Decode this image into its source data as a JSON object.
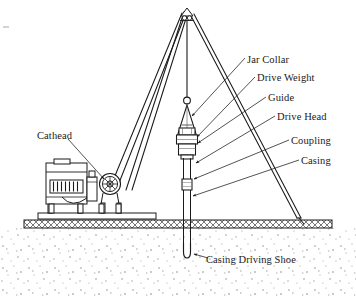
{
  "figure": {
    "background_color": "#ffffff",
    "line_color": "#1a1a1a",
    "labels": {
      "jar_collar": "Jar Collar",
      "drive_weight": "Drive Weight",
      "guide": "Guide",
      "drive_head": "Drive Head",
      "coupling": "Coupling",
      "casing": "Casing",
      "cathead": "Cathead",
      "casing_driving_shoe": "Casing Driving Shoe"
    },
    "parts": [
      {
        "name": "tripod-derrick",
        "description": "three-leg derrick with apex sheave"
      },
      {
        "name": "hoist-line",
        "description": "vertical cable from apex to jar collar"
      },
      {
        "name": "jar-collar",
        "description": "small ring on hoist line"
      },
      {
        "name": "guide",
        "description": "conical guide below jar collar"
      },
      {
        "name": "drive-weight",
        "description": "cylindrical block below guide"
      },
      {
        "name": "drive-head",
        "description": "collar atop the casing"
      },
      {
        "name": "coupling",
        "description": "pipe coupling collar on casing"
      },
      {
        "name": "casing",
        "description": "vertical pipe driven into ground"
      },
      {
        "name": "casing-driving-shoe",
        "description": "rounded tip at bottom of casing"
      },
      {
        "name": "cathead",
        "description": "spoked pulley wheel on the engine skid"
      },
      {
        "name": "engine",
        "description": "power unit with radiator grille on skid"
      },
      {
        "name": "skid-base",
        "description": "platform resting on the ground"
      },
      {
        "name": "ground-line",
        "description": "hatched ground surface band"
      },
      {
        "name": "soil",
        "description": "stippled soil below ground line"
      }
    ]
  }
}
